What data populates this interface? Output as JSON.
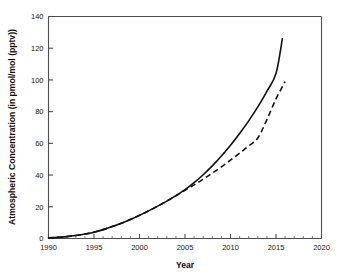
{
  "chart_data": {
    "type": "line",
    "title": "",
    "xlabel": "Year",
    "ylabel": "Atmospheric Concentration (in pmol/mol (pptv))",
    "xlim": [
      1990,
      2020
    ],
    "ylim": [
      0,
      140
    ],
    "xticks": [
      1990,
      1995,
      2000,
      2005,
      2010,
      2015,
      2020
    ],
    "yticks": [
      0,
      20,
      40,
      60,
      80,
      100,
      120,
      140
    ],
    "xtick_labels": [
      "1990",
      "1995",
      "2000",
      "2005",
      "2010",
      "2015",
      "2020"
    ],
    "ytick_labels": [
      "0",
      "20",
      "40",
      "60",
      "80",
      "100",
      "120",
      "140"
    ],
    "x_minor_tick_interval": 1,
    "grid": false,
    "legend": "none",
    "x": [
      1990,
      1991,
      1992,
      1993,
      1994,
      1995,
      1996,
      1997,
      1998,
      1999,
      2000,
      2001,
      2002,
      2003,
      2004,
      2005,
      2006,
      2007,
      2008,
      2009,
      2010,
      2011,
      2012,
      2013,
      2014,
      2015,
      2015.7,
      2016
    ],
    "series": [
      {
        "name": "solid-curve",
        "style": "solid",
        "color": "#111111",
        "x": [
          1990,
          1991,
          1992,
          1993,
          1994,
          1995,
          1996,
          1997,
          1998,
          1999,
          2000,
          2001,
          2002,
          2003,
          2004,
          2005,
          2006,
          2007,
          2008,
          2009,
          2010,
          2011,
          2012,
          2013,
          2014,
          2015,
          2015.7
        ],
        "values": [
          0.4,
          0.7,
          1.2,
          1.9,
          2.8,
          4.0,
          5.6,
          7.5,
          9.6,
          12.0,
          14.6,
          17.4,
          20.4,
          23.6,
          27.0,
          30.8,
          35.2,
          40.2,
          45.8,
          52.0,
          58.8,
          66.2,
          74.2,
          83.0,
          92.8,
          104.0,
          126.0
        ]
      },
      {
        "name": "dashed-curve",
        "style": "dashed",
        "color": "#111111",
        "x": [
          1990,
          1991,
          1992,
          1993,
          1994,
          1995,
          1996,
          1997,
          1998,
          1999,
          2000,
          2001,
          2002,
          2003,
          2004,
          2005,
          2006,
          2007,
          2008,
          2009,
          2010,
          2011,
          2012,
          2013,
          2014,
          2015,
          2016
        ],
        "values": [
          0.4,
          0.7,
          1.2,
          1.9,
          2.8,
          4.0,
          5.6,
          7.5,
          9.6,
          12.0,
          14.6,
          17.4,
          20.4,
          23.6,
          27.0,
          30.4,
          33.8,
          37.4,
          41.2,
          45.2,
          49.4,
          53.8,
          58.4,
          63.4,
          75.0,
          88.0,
          99.0
        ]
      }
    ],
    "annotations": [],
    "notes_divergence_year": 2005
  }
}
